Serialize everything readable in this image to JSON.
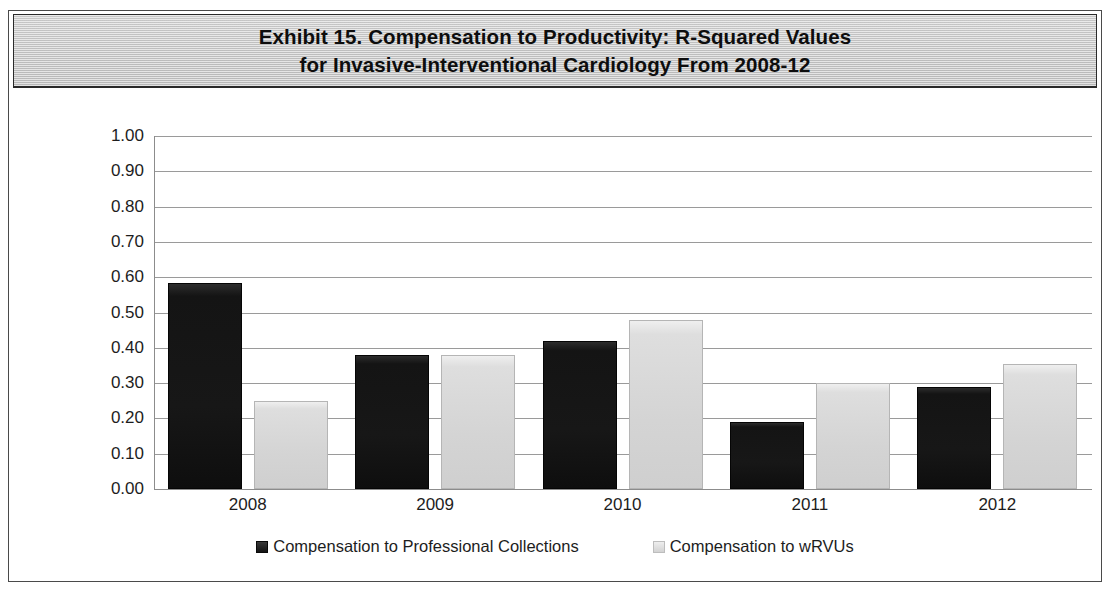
{
  "exhibit": {
    "title_line_1": "Exhibit 15. Compensation to Productivity: R-Squared Values",
    "title_line_2": "for Invasive-Interventional Cardiology From 2008-12"
  },
  "chart_data": {
    "type": "bar",
    "title": "Exhibit 15. Compensation to Productivity: R-Squared Values for Invasive-Interventional Cardiology From 2008-12",
    "xlabel": "",
    "ylabel": "",
    "ylim": [
      0.0,
      1.0
    ],
    "ytick_labels": [
      "1.00",
      "0.90",
      "0.80",
      "0.70",
      "0.60",
      "0.50",
      "0.40",
      "0.30",
      "0.20",
      "0.10",
      "0.00"
    ],
    "ytick_values": [
      1.0,
      0.9,
      0.8,
      0.7,
      0.6,
      0.5,
      0.4,
      0.3,
      0.2,
      0.1,
      0.0
    ],
    "grid": true,
    "legend_position": "bottom",
    "categories": [
      "2008",
      "2009",
      "2010",
      "2011",
      "2012"
    ],
    "series": [
      {
        "name": "Compensation to Professional Collections",
        "color": "#141414",
        "values": [
          0.585,
          0.38,
          0.42,
          0.19,
          0.29
        ]
      },
      {
        "name": "Compensation to wRVUs",
        "color": "#d4d4d4",
        "values": [
          0.25,
          0.38,
          0.48,
          0.3,
          0.355
        ]
      }
    ]
  },
  "legend": {
    "entries": [
      {
        "label": "Compensation to Professional Collections",
        "swatch": "dark"
      },
      {
        "label": "Compensation to wRVUs",
        "swatch": "light"
      }
    ]
  }
}
